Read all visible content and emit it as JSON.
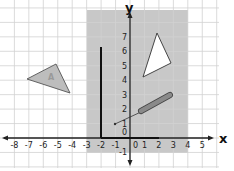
{
  "diagram": {
    "axes": {
      "x_name": "x",
      "y_name": "y",
      "x_ticks": [
        "-8",
        "-7",
        "-6",
        "-5",
        "-4",
        "-3",
        "-2",
        "-1",
        "0",
        "1",
        "2",
        "3",
        "4",
        "5"
      ],
      "y_ticks": [
        "-1",
        "0",
        "1",
        "2",
        "3",
        "4",
        "5",
        "6",
        "7"
      ],
      "x_range": [
        -8,
        5
      ],
      "y_range": [
        -1,
        7
      ]
    },
    "shaded_region": {
      "x": [
        -3,
        4
      ],
      "y": [
        -1,
        8
      ],
      "color": "#c8c8c8"
    },
    "shapes": {
      "triangle_a": {
        "label": "A",
        "vertices": [
          [
            -7,
            4
          ],
          [
            -4.5,
            5
          ],
          [
            -4,
            3
          ]
        ],
        "fill": "#b8b8b8"
      },
      "triangle_white": {
        "vertices": [
          [
            2,
            7
          ],
          [
            3,
            5
          ],
          [
            1,
            4
          ]
        ],
        "fill": "#ffffff"
      },
      "vertical_line": {
        "from": [
          -2,
          0
        ],
        "to": [
          -2,
          6
        ]
      },
      "horizontal_segment": {
        "from": [
          -2,
          0
        ],
        "to": [
          2,
          0
        ]
      },
      "thin_line": {
        "from": [
          -1,
          1
        ],
        "to": [
          1,
          2
        ]
      },
      "bar": {
        "from": [
          0.7,
          2
        ],
        "to": [
          3,
          3
        ],
        "fill": "#888888"
      }
    },
    "colors": {
      "grid": "#d6d6d6",
      "axis": "#222222",
      "shading": "#c8c8c8"
    }
  }
}
